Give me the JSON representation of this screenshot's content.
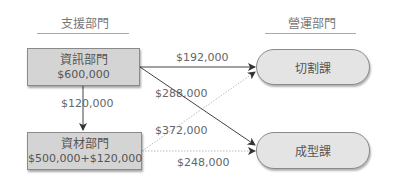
{
  "headers": {
    "support": "支援部門",
    "operating": "營運部門"
  },
  "support_departments": [
    {
      "name": "資訊部門",
      "amount": "$600,000"
    },
    {
      "name": "資材部門",
      "amount": "$500,000+$120,000"
    }
  ],
  "operating_departments": [
    {
      "name": "切割課"
    },
    {
      "name": "成型課"
    }
  ],
  "flows": [
    {
      "from": "資訊部門",
      "to": "資材部門",
      "amount": "$120,000",
      "style": "solid"
    },
    {
      "from": "資訊部門",
      "to": "切割課",
      "amount": "$192,000",
      "style": "solid"
    },
    {
      "from": "資訊部門",
      "to": "成型課",
      "amount": "$288,000",
      "style": "solid"
    },
    {
      "from": "資材部門",
      "to": "切割課",
      "amount": "$372,000",
      "style": "dotted"
    },
    {
      "from": "資材部門",
      "to": "成型課",
      "amount": "$248,000",
      "style": "dotted"
    }
  ],
  "colors": {
    "box_fill": "#d4d4d4",
    "pill_fill": "#e4e4e4",
    "border": "#8a8a8a",
    "line": "#444444",
    "dotted": "#bbbbbb"
  }
}
